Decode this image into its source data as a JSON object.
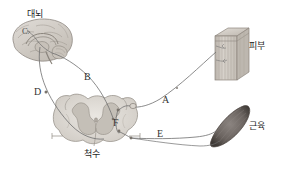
{
  "figure": {
    "type": "biology-diagram",
    "background_color": "#ffffff",
    "width": 287,
    "height": 169
  },
  "structures": [
    {
      "id": "cerebrum",
      "label": "대뇌",
      "label_x": 27,
      "label_y": 10,
      "art": "sagittal brain section"
    },
    {
      "id": "skin",
      "label": "피부",
      "label_x": 249,
      "label_y": 42,
      "art": "layered skin block"
    },
    {
      "id": "muscle",
      "label": "근육",
      "label_x": 249,
      "label_y": 122,
      "art": "spindle shaped muscle"
    },
    {
      "id": "spinal-cord",
      "label": "척수",
      "label_x": 84,
      "label_y": 150,
      "art": "spinal cord cross section"
    }
  ],
  "pathway_labels": [
    {
      "id": "A",
      "text": "A",
      "x": 162,
      "y": 95,
      "note": "sensory nerve from skin to spinal cord"
    },
    {
      "id": "B",
      "text": "B",
      "x": 84,
      "y": 72,
      "note": "ascending tract to cerebrum"
    },
    {
      "id": "C",
      "text": "C",
      "x": 22,
      "y": 27,
      "note": "cerebral cortex region"
    },
    {
      "id": "D",
      "text": "D",
      "x": 34,
      "y": 87,
      "note": "descending tract from cerebrum"
    },
    {
      "id": "E",
      "text": "E",
      "x": 157,
      "y": 129,
      "note": "motor nerve to muscle"
    },
    {
      "id": "F",
      "text": "F",
      "x": 113,
      "y": 118,
      "note": "synapse inside spinal cord gray matter"
    }
  ],
  "colors": {
    "nerve_line": "#6f6f6f",
    "brain_fill": "#d6d2cd",
    "brain_stroke": "#9a948d",
    "skin_fill": "#cfc9c2",
    "skin_stroke": "#8c857d",
    "muscle_fill": "#6b6460",
    "muscle_stroke": "#4a443f",
    "cord_fill": "#dedbd6",
    "cord_stroke": "#9b958e",
    "gray_matter": "#c9c4bd",
    "text": "#2b2b2b"
  }
}
